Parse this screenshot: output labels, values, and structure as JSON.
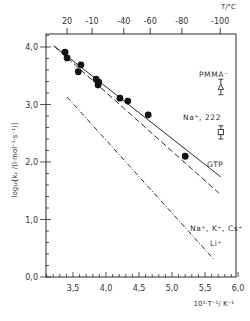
{
  "chart_data": {
    "type": "scatter",
    "title": "",
    "xlabel": "10³·T⁻¹/K⁻¹",
    "ylabel": "log₁₀[kₚ/(l·mol⁻¹·s⁻¹)]",
    "top_axis_label": "T/°C",
    "xlim": [
      3.09,
      6.0
    ],
    "ylim": [
      0.0,
      4.2
    ],
    "x_ticks": [
      3.5,
      4.0,
      4.5,
      5.0,
      5.5,
      6.0
    ],
    "x_tick_labels": [
      "3,5",
      "4,0",
      "4,5",
      "5,0",
      "5,5",
      "6,0"
    ],
    "y_ticks": [
      0.0,
      1.0,
      2.0,
      3.0,
      4.0
    ],
    "y_tick_labels": [
      "0,0",
      "1,0",
      "2,0",
      "3,0",
      "4,0"
    ],
    "top_ticks": [
      {
        "label": "20",
        "x": 3.41
      },
      {
        "label": "-10",
        "x": 3.79
      },
      {
        "label": "-40",
        "x": 4.27
      },
      {
        "label": "-60",
        "x": 4.67
      },
      {
        "label": "-80",
        "x": 5.15
      },
      {
        "label": "-100",
        "x": 5.73
      }
    ],
    "grid": false,
    "series": [
      {
        "name": "experimental points",
        "type": "scatter",
        "marker": "filled-circle",
        "points": [
          [
            3.38,
            3.91
          ],
          [
            3.41,
            3.81
          ],
          [
            3.62,
            3.69
          ],
          [
            3.58,
            3.57
          ],
          [
            3.85,
            3.44
          ],
          [
            3.89,
            3.39
          ],
          [
            3.88,
            3.34
          ],
          [
            4.21,
            3.11
          ],
          [
            4.33,
            3.06
          ],
          [
            4.64,
            2.82
          ],
          [
            5.2,
            2.1
          ]
        ]
      },
      {
        "name": "GTP",
        "type": "line",
        "style": "solid",
        "points": [
          [
            3.21,
            4.02
          ],
          [
            5.74,
            1.74
          ]
        ],
        "label_pos": [
          5.6,
          1.9
        ]
      },
      {
        "name": "Na⁺, K⁺, Cs⁺",
        "type": "line",
        "style": "dashed",
        "points": [
          [
            3.21,
            4.02
          ],
          [
            5.71,
            1.46
          ]
        ],
        "label_pos": [
          5.2,
          1.03
        ]
      },
      {
        "name": "Li⁺",
        "type": "line",
        "style": "dash-dot",
        "points": [
          [
            3.41,
            3.13
          ],
          [
            5.64,
            0.3
          ]
        ],
        "label_pos": [
          5.72,
          0.6
        ]
      },
      {
        "name": "PMMA⁻",
        "type": "errorbar",
        "marker": "open-triangle",
        "x": 5.74,
        "y": 3.3,
        "ymin": 3.17,
        "ymax": 3.44,
        "label_pos": [
          5.42,
          3.57
        ]
      },
      {
        "name": "Na⁺, 222",
        "type": "errorbar",
        "marker": "open-square",
        "x": 5.74,
        "y": 2.52,
        "ymin": 2.4,
        "ymax": 2.63,
        "label_pos": [
          5.18,
          2.8
        ]
      }
    ]
  },
  "labels": {
    "xlabel": "10³·T⁻¹/ K⁻¹",
    "ylabel": "log₁₀[kₚ /(l·mol⁻¹·s⁻¹)]",
    "top_axis": "T/°C",
    "gtp": "GTP",
    "nakcs": "Na⁺, K⁺, Cs⁺",
    "li": "Li⁺",
    "pmma": "PMMA⁻",
    "na222": "Na⁺, 222"
  },
  "colors": {
    "ink": "#2a2a2a",
    "background": "#ffffff"
  }
}
